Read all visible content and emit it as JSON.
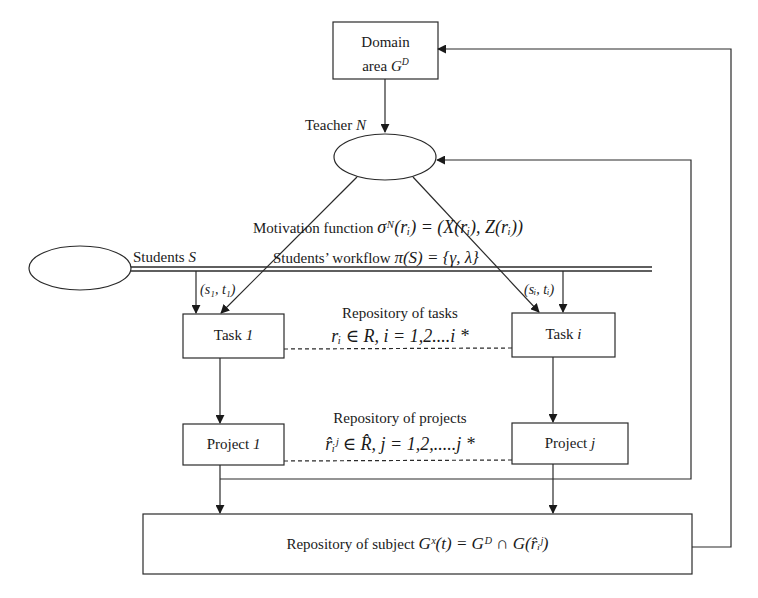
{
  "nodes": {
    "domain": {
      "line1": "Domain",
      "line2_prefix": "area ",
      "symbol": "G",
      "superscript": "D"
    },
    "teacher": {
      "label_prefix": "Teacher ",
      "symbol": "N"
    },
    "students": {
      "label_prefix": "Students ",
      "symbol": "S"
    },
    "task_1": {
      "prefix": "Task ",
      "index": "1"
    },
    "task_i": {
      "prefix": "Task ",
      "index": "i"
    },
    "project_1": {
      "prefix": "Project ",
      "index": "1"
    },
    "project_j": {
      "prefix": "Project ",
      "index": "j"
    },
    "subject": {
      "prefix": "Repository of subject ",
      "formula": "Gˣ(t) = Gᴰ ∩ G(r̂ᵢʲ)"
    }
  },
  "labels": {
    "motivation": {
      "prefix": "Motivation function ",
      "formula": "σᴺ(rᵢ) = (X(rᵢ), Z(rᵢ))"
    },
    "workflow": {
      "prefix": "Students’ workflow ",
      "formula": "π(S) = {γ, λ}"
    },
    "edge_s1": "(s₁, t₁)",
    "edge_si": "(sᵢ, tᵢ)",
    "tasks_repo": {
      "title": "Repository of tasks",
      "formula": "rᵢ ∈ R, i = 1,2....i *"
    },
    "projects_repo": {
      "title": "Repository of projects",
      "formula": "r̂ᵢʲ ∈ R̂, j = 1,2,.....j *"
    }
  },
  "colors": {
    "stroke": "#2a2a2a",
    "background": "#ffffff"
  }
}
